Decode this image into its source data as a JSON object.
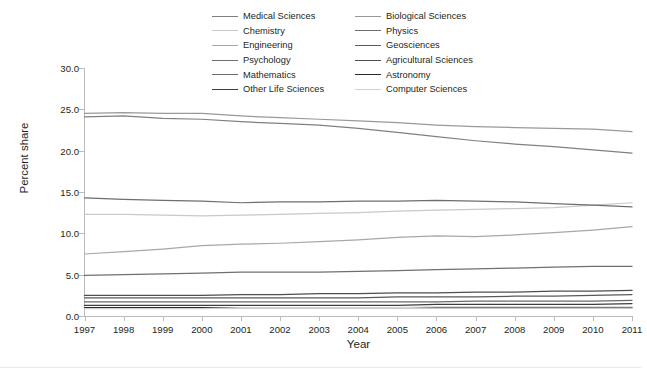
{
  "chart_data": {
    "type": "line",
    "title": "",
    "xlabel": "Year",
    "ylabel": "Percent share",
    "x": [
      1997,
      1998,
      1999,
      2000,
      2001,
      2002,
      2003,
      2004,
      2005,
      2006,
      2007,
      2008,
      2009,
      2010,
      2011
    ],
    "xlim": [
      1997,
      2011
    ],
    "ylim": [
      0.0,
      30.0
    ],
    "yticks": [
      "0.0",
      "5.0",
      "10.0",
      "15.0",
      "20.0",
      "25.0",
      "30.0"
    ],
    "ytick_values": [
      0.0,
      5.0,
      10.0,
      15.0,
      20.0,
      25.0,
      30.0
    ],
    "xticks": [
      "1997",
      "1998",
      "1999",
      "2000",
      "2001",
      "2002",
      "2003",
      "2004",
      "2005",
      "2006",
      "2007",
      "2008",
      "2009",
      "2010",
      "2011"
    ],
    "grid": false,
    "legend_position": "top-center",
    "legend_columns": 2,
    "series": [
      {
        "name": "Medical Sciences",
        "color": "#808080",
        "values": [
          24.1,
          24.2,
          23.9,
          23.8,
          23.5,
          23.3,
          23.1,
          22.7,
          22.2,
          21.7,
          21.2,
          20.8,
          20.5,
          20.1,
          19.7
        ]
      },
      {
        "name": "Biological Sciences",
        "color": "#999999",
        "values": [
          24.5,
          24.6,
          24.5,
          24.5,
          24.2,
          24.0,
          23.8,
          23.6,
          23.4,
          23.1,
          22.9,
          22.8,
          22.7,
          22.6,
          22.3
        ]
      },
      {
        "name": "Chemistry",
        "color": "#c9c9c9",
        "values": [
          12.3,
          12.3,
          12.2,
          12.1,
          12.2,
          12.3,
          12.4,
          12.5,
          12.7,
          12.8,
          12.9,
          13.0,
          13.1,
          13.4,
          13.7
        ]
      },
      {
        "name": "Physics",
        "color": "#6e6e6e",
        "values": [
          14.3,
          14.1,
          14.0,
          13.9,
          13.7,
          13.8,
          13.8,
          13.9,
          13.9,
          14.0,
          13.9,
          13.8,
          13.6,
          13.4,
          13.2
        ]
      },
      {
        "name": "Engineering",
        "color": "#a8a8a8",
        "values": [
          7.5,
          7.8,
          8.1,
          8.5,
          8.7,
          8.8,
          9.0,
          9.2,
          9.5,
          9.7,
          9.6,
          9.8,
          10.1,
          10.4,
          10.8
        ]
      },
      {
        "name": "Geosciences",
        "color": "#5a5a5a",
        "values": [
          2.2,
          2.2,
          2.2,
          2.2,
          2.2,
          2.2,
          2.2,
          2.2,
          2.3,
          2.3,
          2.3,
          2.4,
          2.4,
          2.5,
          2.6
        ]
      },
      {
        "name": "Psychology",
        "color": "#707070",
        "values": [
          4.9,
          5.0,
          5.1,
          5.2,
          5.3,
          5.3,
          5.3,
          5.4,
          5.5,
          5.6,
          5.7,
          5.8,
          5.9,
          6.0,
          6.0
        ]
      },
      {
        "name": "Agricultural Sciences",
        "color": "#4f4f4f",
        "values": [
          2.5,
          2.5,
          2.5,
          2.5,
          2.6,
          2.6,
          2.7,
          2.7,
          2.8,
          2.8,
          2.9,
          2.9,
          3.0,
          3.0,
          3.1
        ]
      },
      {
        "name": "Mathematics",
        "color": "#6b6b6b",
        "values": [
          1.7,
          1.7,
          1.7,
          1.7,
          1.7,
          1.7,
          1.7,
          1.7,
          1.7,
          1.7,
          1.8,
          1.8,
          1.8,
          1.8,
          1.9
        ]
      },
      {
        "name": "Astronomy",
        "color": "#2b2b2b",
        "values": [
          1.0,
          1.0,
          1.0,
          1.0,
          1.0,
          1.0,
          1.0,
          1.0,
          1.0,
          1.0,
          1.0,
          1.0,
          1.0,
          1.0,
          1.0
        ]
      },
      {
        "name": "Other Life Sciences",
        "color": "#3d3d3d",
        "values": [
          1.3,
          1.3,
          1.3,
          1.3,
          1.3,
          1.3,
          1.3,
          1.3,
          1.3,
          1.4,
          1.4,
          1.4,
          1.4,
          1.4,
          1.5
        ]
      },
      {
        "name": "Computer Sciences",
        "color": "#d2d2d2",
        "values": [
          0.9,
          0.9,
          0.9,
          0.9,
          1.0,
          1.0,
          1.0,
          1.0,
          1.0,
          1.1,
          1.1,
          1.1,
          1.1,
          1.1,
          1.1
        ]
      }
    ]
  },
  "legend": {
    "items": [
      {
        "label": "Medical Sciences",
        "color": "#808080"
      },
      {
        "label": "Biological Sciences",
        "color": "#999999"
      },
      {
        "label": "Chemistry",
        "color": "#c9c9c9"
      },
      {
        "label": "Physics",
        "color": "#6e6e6e"
      },
      {
        "label": "Engineering",
        "color": "#a8a8a8"
      },
      {
        "label": "Geosciences",
        "color": "#5a5a5a"
      },
      {
        "label": "Psychology",
        "color": "#707070"
      },
      {
        "label": "Agricultural Sciences",
        "color": "#4f4f4f"
      },
      {
        "label": "Mathematics",
        "color": "#6b6b6b"
      },
      {
        "label": "Astronomy",
        "color": "#2b2b2b"
      },
      {
        "label": "Other Life Sciences",
        "color": "#3d3d3d"
      },
      {
        "label": "Computer Sciences",
        "color": "#d2d2d2"
      }
    ]
  },
  "axes": {
    "y_title": "Percent share",
    "x_title": "Year"
  }
}
